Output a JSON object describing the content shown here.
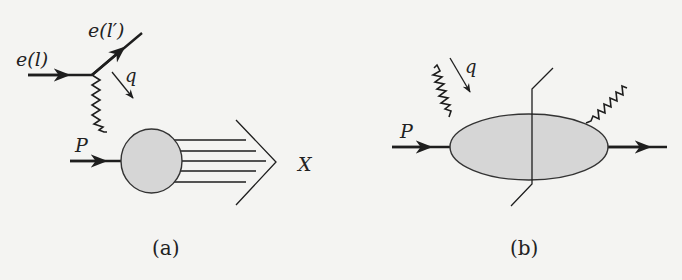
{
  "figure": {
    "background": "#f4f4f2",
    "ink_color": "#1e1e1e",
    "blob_fill": "#d6d6d6",
    "panel_a": {
      "caption": "(a)",
      "incoming_electron_label": "e(l)",
      "outgoing_electron_label": "e(l′)",
      "photon_momentum_label": "q",
      "proton_label": "P",
      "final_state_label": "X",
      "final_state_line_count": 5
    },
    "panel_b": {
      "caption": "(b)",
      "photon_momentum_label": "q",
      "proton_label": "P",
      "has_cut_line": true
    }
  }
}
